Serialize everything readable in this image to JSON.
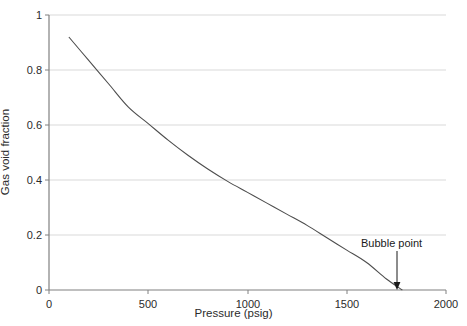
{
  "chart_data": {
    "type": "line",
    "title": "",
    "xlabel": "Pressure (psig)",
    "ylabel": "Gas void fraction",
    "xlim": [
      0,
      2000
    ],
    "ylim": [
      0,
      1
    ],
    "xticks": [
      0,
      500,
      1000,
      1500,
      2000
    ],
    "xticklabels": [
      "0",
      "500",
      "1000",
      "1500",
      "2000"
    ],
    "yticks": [
      0,
      0.2,
      0.4,
      0.6,
      0.8,
      1
    ],
    "yticklabels": [
      "0",
      "0.2",
      "0.4",
      "0.6",
      "0.8",
      "1"
    ],
    "grid": "horizontal",
    "legend": "none",
    "series": [
      {
        "name": "Gas void fraction vs pressure",
        "color": "#4d4d4d",
        "x": [
          100,
          200,
          300,
          400,
          500,
          600,
          700,
          800,
          900,
          1000,
          1100,
          1200,
          1300,
          1400,
          1500,
          1600,
          1700,
          1780
        ],
        "y": [
          0.92,
          0.835,
          0.75,
          0.665,
          0.605,
          0.545,
          0.49,
          0.44,
          0.395,
          0.355,
          0.315,
          0.275,
          0.235,
          0.19,
          0.145,
          0.1,
          0.04,
          0.0
        ]
      }
    ],
    "annotations": [
      {
        "text": "Bubble point",
        "x": 1780,
        "y": 0,
        "arrow": true,
        "label_x": 1780,
        "label_y": 0.18
      }
    ]
  },
  "colors": {
    "axis": "#808080",
    "grid": "#d9d9d9",
    "curve": "#4d4d4d",
    "text": "#2b2b2b",
    "annotation": "#1a1a1a",
    "background": "#ffffff"
  }
}
